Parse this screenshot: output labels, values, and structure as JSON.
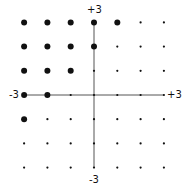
{
  "diagram": {
    "axis_labels": {
      "y_top": "+3",
      "y_bottom": "-3",
      "x_left": "-3",
      "x_right": "+3"
    },
    "grid_range": [
      -3,
      3
    ],
    "rule": "large dot where y - x >= 2",
    "large_points": [
      [
        -3,
        3
      ],
      [
        -2,
        3
      ],
      [
        -1,
        3
      ],
      [
        0,
        3
      ],
      [
        1,
        3
      ],
      [
        -3,
        2
      ],
      [
        -2,
        2
      ],
      [
        -1,
        2
      ],
      [
        0,
        2
      ],
      [
        -3,
        1
      ],
      [
        -2,
        1
      ],
      [
        -1,
        1
      ],
      [
        -3,
        0
      ],
      [
        -2,
        0
      ],
      [
        -3,
        -1
      ]
    ],
    "colors": {
      "dot": "#111111",
      "axis": "#555555"
    }
  }
}
